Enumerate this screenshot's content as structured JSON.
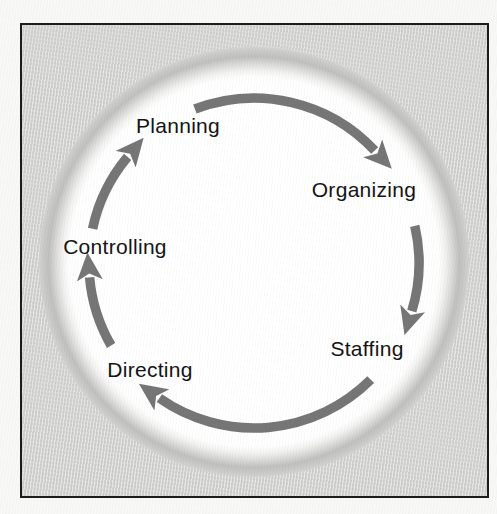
{
  "diagram": {
    "type": "cycle",
    "steps": [
      {
        "id": "planning",
        "label": "Planning"
      },
      {
        "id": "organizing",
        "label": "Organizing"
      },
      {
        "id": "staffing",
        "label": "Staffing"
      },
      {
        "id": "directing",
        "label": "Directing"
      },
      {
        "id": "controlling",
        "label": "Controlling"
      }
    ],
    "arrows": [
      {
        "from": "planning",
        "to": "organizing"
      },
      {
        "from": "organizing",
        "to": "staffing"
      },
      {
        "from": "staffing",
        "to": "directing"
      },
      {
        "from": "directing",
        "to": "controlling"
      },
      {
        "from": "controlling",
        "to": "planning"
      }
    ],
    "direction": "clockwise",
    "colors": {
      "arrow": "#767676",
      "circle": "#ffffff",
      "panel_background": "#d4d4d3",
      "page_background": "#f6f6f4",
      "border": "#1c1c1c",
      "text": "#141414"
    }
  }
}
